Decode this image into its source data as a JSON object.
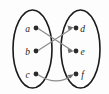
{
  "figure": {
    "background_color": "#fdfdfd",
    "ellipse_stroke": "#1a1a1a",
    "edge_color": "#8d8d8d",
    "vertex_color": "#2b2b2b",
    "label_color": "#1c1c1c",
    "arrowhead_color": "#6f6f6f"
  },
  "sets": [
    {
      "name": "domain-set",
      "cx": 32.5,
      "cy": 49,
      "rx": 19.5,
      "ry": 39
    },
    {
      "name": "codomain-set",
      "cx": 80.5,
      "cy": 49,
      "rx": 19.5,
      "ry": 39
    }
  ],
  "vertices": [
    {
      "id": "a",
      "label": "a",
      "set": "domain-set",
      "dot_x": 36,
      "dot_y": 28,
      "label_x": 27.5,
      "label_y": 31.5
    },
    {
      "id": "b",
      "label": "b",
      "set": "domain-set",
      "dot_x": 36,
      "dot_y": 51,
      "label_x": 27.5,
      "label_y": 54.5
    },
    {
      "id": "c",
      "label": "c",
      "set": "domain-set",
      "dot_x": 36,
      "dot_y": 74,
      "label_x": 27.5,
      "label_y": 77.5
    },
    {
      "id": "d",
      "label": "d",
      "set": "codomain-set",
      "dot_x": 76,
      "dot_y": 28,
      "label_x": 82.5,
      "label_y": 31.5
    },
    {
      "id": "e",
      "label": "e",
      "set": "codomain-set",
      "dot_x": 76,
      "dot_y": 51,
      "label_x": 82.5,
      "label_y": 54.5
    },
    {
      "id": "f",
      "label": "f",
      "set": "codomain-set",
      "dot_x": 76,
      "dot_y": 74,
      "label_x": 82.5,
      "label_y": 77.5
    }
  ],
  "edges": [
    {
      "id": "edge-a-e",
      "from": "a",
      "to": "e",
      "path": "M 38.5 28.8 L 71.5 50.2",
      "arrow_points": "73.8,51.0 67.6,48.6 68.6,53.2",
      "directed": true
    },
    {
      "id": "edge-b-d",
      "from": "b",
      "to": "d",
      "path": "M 38.5 50.2 L 71.5 28.8",
      "arrow_points": "73.8,27.6 67.6,25.6 68.6,30.2",
      "directed": true
    },
    {
      "id": "edge-c-f",
      "from": "c",
      "to": "f",
      "path": "M 38.5 75.0 C 50 82.5, 62 82.5, 71.8 75.8",
      "arrow_points": "73.8,74.2 67.3,75.1 70.3,78.6",
      "directed": true
    }
  ]
}
